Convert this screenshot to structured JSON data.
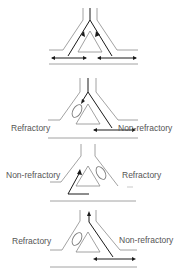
{
  "diagram": {
    "type": "branched-pathway-reentry",
    "colors": {
      "outline": "#8a8a8a",
      "impulse": "#1a1a1a",
      "zone": "#7a7a7a"
    },
    "panels": [
      {
        "id": "panel-1",
        "left_label": "",
        "right_label": "",
        "description": "Impulse travels down both limbs and exits bidirectionally"
      },
      {
        "id": "panel-2",
        "left_label": "Refractory",
        "right_label": "Non-refractory",
        "description": "Left limb refractory; impulse conducts down right limb"
      },
      {
        "id": "panel-3",
        "left_label": "Non-refractory",
        "right_label": "Refractory",
        "description": "Impulse returns retrogradely up left limb"
      },
      {
        "id": "panel-4",
        "left_label": "Refractory",
        "right_label": "Non-refractory",
        "description": "Impulse re-enters and exits proximally (re-entry)"
      }
    ]
  }
}
